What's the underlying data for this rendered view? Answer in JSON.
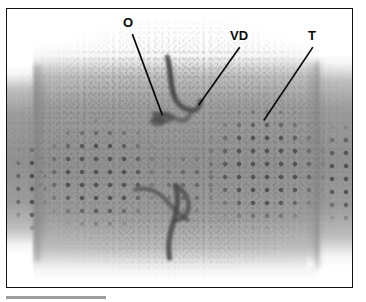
{
  "figure": {
    "kind": "micrograph",
    "background_color": "#ffffff",
    "frame": {
      "border_color": "#111111",
      "border_width_px": 1.6,
      "x": 6,
      "y": 8,
      "width": 347,
      "height": 280
    },
    "tissue": {
      "base_gray": "#929292",
      "highlight_gray": "#d6d6d6",
      "pore_gray": "#4e4e4e",
      "duct_gray": "#4a4a4a"
    }
  },
  "annotations": {
    "items": [
      {
        "id": "o",
        "label": "O",
        "meaning": "opening",
        "label_x": 123,
        "label_y": 16,
        "leader": {
          "x1": 131,
          "y1": 33,
          "x2": 161,
          "y2": 114
        }
      },
      {
        "id": "vd",
        "label": "VD",
        "meaning": "vas deferens",
        "label_x": 230,
        "label_y": 29,
        "leader": {
          "x1": 238,
          "y1": 46,
          "x2": 197,
          "y2": 104
        }
      },
      {
        "id": "t",
        "label": "T",
        "meaning": "tubercle field",
        "label_x": 308,
        "label_y": 29,
        "leader": {
          "x1": 311,
          "y1": 46,
          "x2": 262,
          "y2": 119
        }
      }
    ],
    "text_color": "#0b0b0b",
    "leader_color": "#0b0b0b"
  },
  "scale_bar": {
    "present": true,
    "color": "#9d9d9d",
    "x": 6,
    "y": 296,
    "width": 100,
    "height": 3,
    "caption": ""
  }
}
